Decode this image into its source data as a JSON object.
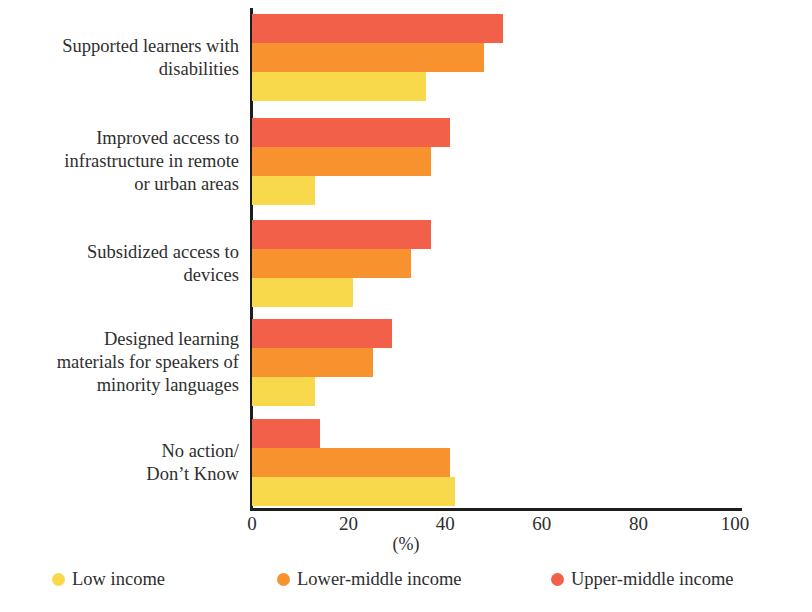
{
  "chart_data": {
    "type": "bar",
    "orientation": "horizontal",
    "title": "",
    "xlabel": "(%)",
    "ylabel": "",
    "xlim": [
      0,
      100
    ],
    "xticks": [
      "0",
      "20",
      "40",
      "60",
      "80",
      "100"
    ],
    "grid": false,
    "legend_position": "bottom",
    "categories": [
      "Supported learners with\ndisabilities",
      "Improved access to\ninfrastructure in remote\nor urban areas",
      "Subsidized access to\ndevices",
      "Designed learning\nmaterials for speakers of\nminority languages",
      "No action/\nDon’t Know"
    ],
    "series": [
      {
        "name": "Upper-middle income",
        "color": "#f2604a",
        "values": [
          52,
          41,
          37,
          29,
          14
        ]
      },
      {
        "name": "Lower-middle income",
        "color": "#f7922f",
        "values": [
          48,
          37,
          33,
          25,
          41
        ]
      },
      {
        "name": "Low income",
        "color": "#f8d94c",
        "values": [
          36,
          13,
          21,
          13,
          42
        ]
      }
    ]
  },
  "legend": {
    "items": [
      {
        "label": "Low income",
        "color": "#f8d94c"
      },
      {
        "label": "Lower-middle income",
        "color": "#f7922f"
      },
      {
        "label": "Upper-middle income",
        "color": "#f2604a"
      }
    ]
  },
  "axis": {
    "unit_label": "(%)"
  }
}
